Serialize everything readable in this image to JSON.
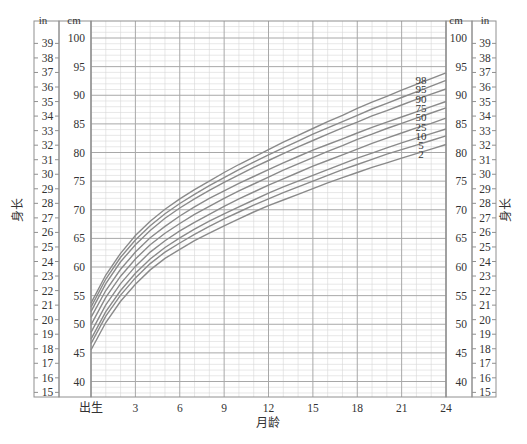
{
  "chart_data": {
    "type": "line",
    "title": "",
    "xlabel": "月龄",
    "ylabel_left": "身长",
    "ylabel_right": "身长",
    "x_tick_labels": [
      "出生",
      "3",
      "6",
      "9",
      "12",
      "15",
      "18",
      "21",
      "24"
    ],
    "x_ticks": [
      0,
      3,
      6,
      9,
      12,
      15,
      18,
      21,
      24
    ],
    "xlim": [
      0,
      24
    ],
    "cm_axis": {
      "unit": "cm",
      "ticks": [
        40,
        45,
        50,
        55,
        60,
        65,
        70,
        75,
        80,
        85,
        90,
        95,
        100
      ],
      "range": [
        37.2,
        103
      ]
    },
    "in_axis": {
      "unit": "in",
      "ticks": [
        15,
        16,
        17,
        18,
        19,
        20,
        21,
        22,
        23,
        24,
        25,
        26,
        27,
        28,
        29,
        30,
        31,
        32,
        33,
        34,
        35,
        36,
        37,
        38,
        39
      ]
    },
    "grid": true,
    "legend_position": "curve-end labels at right",
    "x": [
      0,
      1,
      2,
      3,
      4,
      5,
      6,
      7,
      8,
      9,
      10,
      11,
      12,
      13,
      14,
      15,
      16,
      17,
      18,
      19,
      20,
      21,
      22,
      23,
      24
    ],
    "series": [
      {
        "name": "98",
        "values": [
          53.7,
          58.6,
          62.4,
          65.5,
          68.0,
          70.1,
          71.9,
          73.5,
          75.0,
          76.5,
          77.9,
          79.2,
          80.5,
          81.8,
          83.0,
          84.2,
          85.4,
          86.5,
          87.7,
          88.8,
          89.8,
          90.9,
          91.9,
          92.9,
          93.9
        ]
      },
      {
        "name": "95",
        "values": [
          53.0,
          57.9,
          61.7,
          64.7,
          67.2,
          69.3,
          71.1,
          72.7,
          74.2,
          75.6,
          77.0,
          78.3,
          79.6,
          80.8,
          82.0,
          83.2,
          84.3,
          85.4,
          86.5,
          87.6,
          88.6,
          89.6,
          90.6,
          91.6,
          92.6
        ]
      },
      {
        "name": "90",
        "values": [
          52.2,
          57.1,
          60.9,
          63.9,
          66.4,
          68.5,
          70.3,
          71.9,
          73.4,
          74.8,
          76.1,
          77.4,
          78.6,
          79.8,
          81.0,
          82.1,
          83.2,
          84.3,
          85.3,
          86.4,
          87.3,
          88.3,
          89.3,
          90.2,
          91.1
        ]
      },
      {
        "name": "75",
        "values": [
          51.2,
          55.9,
          59.6,
          62.6,
          65.1,
          67.1,
          68.9,
          70.5,
          72.0,
          73.3,
          74.6,
          75.8,
          77.0,
          78.2,
          79.3,
          80.4,
          81.4,
          82.4,
          83.4,
          84.4,
          85.3,
          86.2,
          87.1,
          88.0,
          88.9
        ]
      },
      {
        "name": "50",
        "values": [
          49.9,
          54.7,
          58.4,
          61.4,
          63.9,
          65.9,
          67.6,
          69.2,
          70.6,
          72.0,
          73.3,
          74.5,
          75.7,
          76.9,
          78.0,
          79.1,
          80.2,
          81.2,
          82.3,
          83.2,
          84.2,
          85.1,
          86.0,
          86.9,
          87.8
        ]
      },
      {
        "name": "25",
        "values": [
          48.6,
          53.4,
          57.1,
          60.1,
          62.6,
          64.6,
          66.3,
          67.8,
          69.2,
          70.6,
          71.9,
          73.1,
          74.3,
          75.4,
          76.5,
          77.6,
          78.6,
          79.6,
          80.6,
          81.6,
          82.5,
          83.4,
          84.3,
          85.1,
          86.0
        ]
      },
      {
        "name": "10",
        "values": [
          47.4,
          52.2,
          55.9,
          58.9,
          61.4,
          63.4,
          65.1,
          66.6,
          68.0,
          69.3,
          70.5,
          71.7,
          72.9,
          74.0,
          75.0,
          76.0,
          77.0,
          78.0,
          79.0,
          79.9,
          80.8,
          81.7,
          82.5,
          83.3,
          84.1
        ]
      },
      {
        "name": "5",
        "values": [
          46.6,
          51.4,
          55.1,
          58.1,
          60.6,
          62.6,
          64.2,
          65.7,
          67.1,
          68.4,
          69.6,
          70.8,
          71.9,
          73.0,
          74.0,
          75.0,
          76.0,
          77.0,
          77.9,
          78.8,
          79.7,
          80.5,
          81.3,
          82.1,
          82.9
        ]
      },
      {
        "name": "2",
        "values": [
          45.5,
          50.3,
          54.0,
          57.0,
          59.5,
          61.5,
          63.1,
          64.6,
          65.9,
          67.2,
          68.4,
          69.6,
          70.7,
          71.7,
          72.7,
          73.7,
          74.7,
          75.6,
          76.5,
          77.4,
          78.2,
          79.0,
          79.8,
          80.6,
          81.4
        ]
      }
    ]
  },
  "colors": {
    "curve": "#8a8a8a",
    "grid_major": "#a8a8a8",
    "grid_minor": "#d6d6d6",
    "frame": "#909090",
    "text": "#333333"
  }
}
